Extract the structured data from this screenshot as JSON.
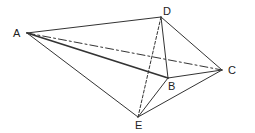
{
  "diagram": {
    "type": "geometric-solid",
    "vertices": {
      "A": {
        "label": "A",
        "x": 27,
        "y": 33,
        "lx": 13,
        "ly": 37
      },
      "B": {
        "label": "B",
        "x": 168,
        "y": 78,
        "lx": 168,
        "ly": 90
      },
      "C": {
        "label": "C",
        "x": 222,
        "y": 70,
        "lx": 228,
        "ly": 74
      },
      "D": {
        "label": "D",
        "x": 161,
        "y": 17,
        "lx": 163,
        "ly": 15
      },
      "E": {
        "label": "E",
        "x": 138,
        "y": 117,
        "lx": 135,
        "ly": 129
      }
    },
    "edges": [
      {
        "from": "A",
        "to": "D",
        "style": "solid"
      },
      {
        "from": "A",
        "to": "B",
        "style": "solid-thick"
      },
      {
        "from": "A",
        "to": "E",
        "style": "solid"
      },
      {
        "from": "A",
        "to": "C",
        "style": "dash-dot"
      },
      {
        "from": "D",
        "to": "C",
        "style": "solid"
      },
      {
        "from": "D",
        "to": "B",
        "style": "solid"
      },
      {
        "from": "D",
        "to": "E",
        "style": "dashed"
      },
      {
        "from": "B",
        "to": "C",
        "style": "solid"
      },
      {
        "from": "B",
        "to": "E",
        "style": "solid"
      },
      {
        "from": "E",
        "to": "C",
        "style": "solid"
      }
    ],
    "colors": {
      "line": "#333333",
      "label": "#222222"
    }
  }
}
